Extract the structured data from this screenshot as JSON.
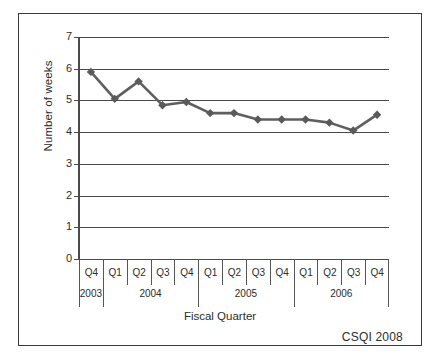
{
  "figure": {
    "credit": "CSQI 2008"
  },
  "chart_data": {
    "type": "line",
    "title": "",
    "xlabel": "Fiscal Quarter",
    "ylabel": "Number of weeks",
    "ylim": [
      0,
      7
    ],
    "yticks": [
      "0",
      "1",
      "2",
      "3",
      "4",
      "5",
      "6",
      "7"
    ],
    "grid": true,
    "legend": "none",
    "marker": "diamond",
    "line_color": "#5f5f5f",
    "marker_color": "#5a5a5a",
    "categories": [
      "Q4",
      "Q1",
      "Q2",
      "Q3",
      "Q4",
      "Q1",
      "Q2",
      "Q3",
      "Q4",
      "Q1",
      "Q2",
      "Q3",
      "Q4"
    ],
    "values": [
      5.9,
      5.05,
      5.6,
      4.85,
      4.95,
      4.6,
      4.6,
      4.4,
      4.4,
      4.4,
      4.3,
      4.05,
      4.55
    ],
    "year_groups": [
      {
        "label": "2003",
        "start": 0,
        "count": 1
      },
      {
        "label": "2004",
        "start": 1,
        "count": 4
      },
      {
        "label": "2005",
        "start": 5,
        "count": 4
      },
      {
        "label": "2006",
        "start": 9,
        "count": 4
      }
    ]
  }
}
